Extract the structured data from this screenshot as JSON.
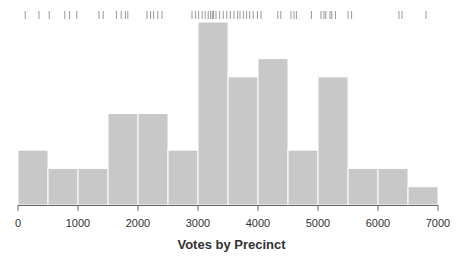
{
  "chart_data": {
    "type": "bar",
    "subtype": "histogram",
    "title": "",
    "xlabel": "Votes by Precinct",
    "ylabel": "",
    "bin_width": 500,
    "bins": [
      {
        "start": 0,
        "end": 500,
        "count": 3
      },
      {
        "start": 500,
        "end": 1000,
        "count": 2
      },
      {
        "start": 1000,
        "end": 1500,
        "count": 2
      },
      {
        "start": 1500,
        "end": 2000,
        "count": 5
      },
      {
        "start": 2000,
        "end": 2500,
        "count": 5
      },
      {
        "start": 2500,
        "end": 3000,
        "count": 3
      },
      {
        "start": 3000,
        "end": 3500,
        "count": 10
      },
      {
        "start": 3500,
        "end": 4000,
        "count": 7
      },
      {
        "start": 4000,
        "end": 4500,
        "count": 8
      },
      {
        "start": 4500,
        "end": 5000,
        "count": 3
      },
      {
        "start": 5000,
        "end": 5500,
        "count": 7
      },
      {
        "start": 5500,
        "end": 6000,
        "count": 2
      },
      {
        "start": 6000,
        "end": 6500,
        "count": 2
      },
      {
        "start": 6500,
        "end": 7000,
        "count": 1
      }
    ],
    "categories": [
      "0-500",
      "500-1000",
      "1000-1500",
      "1500-2000",
      "2000-2500",
      "2500-3000",
      "3000-3500",
      "3500-4000",
      "4000-4500",
      "4500-5000",
      "5000-5500",
      "5500-6000",
      "6000-6500",
      "6500-7000"
    ],
    "values": [
      3,
      2,
      2,
      5,
      5,
      3,
      10,
      7,
      8,
      3,
      7,
      2,
      2,
      1
    ],
    "xlim": [
      0,
      7000
    ],
    "ylim": [
      0,
      10
    ],
    "x_ticks": [
      "0",
      "1000",
      "2000",
      "3000",
      "4000",
      "5000",
      "6000",
      "7000"
    ],
    "grid": false,
    "legend": null,
    "rug": true,
    "rug_positions": [
      120,
      350,
      520,
      780,
      860,
      980,
      1350,
      1420,
      1640,
      1720,
      1790,
      1830,
      2150,
      2210,
      2260,
      2330,
      2400,
      2900,
      2960,
      3010,
      3070,
      3120,
      3170,
      3210,
      3240,
      3260,
      3300,
      3360,
      3420,
      3480,
      3540,
      3600,
      3660,
      3700,
      3760,
      3810,
      3860,
      3920,
      3990,
      4050,
      4330,
      4380,
      4550,
      4600,
      4640,
      4890,
      5050,
      5100,
      5130,
      5200,
      5230,
      5290,
      5500,
      5560,
      6350,
      6400,
      6800
    ]
  },
  "colors": {
    "bar": "#c8c8c8",
    "bar_edge": "#ffffff",
    "axis": "#666666",
    "text": "#333333",
    "rug": "#999999"
  }
}
